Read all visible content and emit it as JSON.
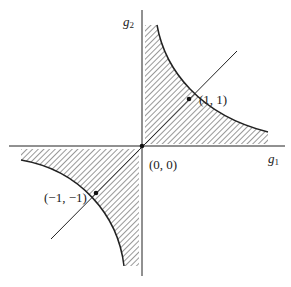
{
  "diagram": {
    "axes": {
      "x_label": "g",
      "x_sub": "1",
      "y_label": "g",
      "y_sub": "2"
    },
    "points": [
      {
        "label": "(1, 1)",
        "x": 1,
        "y": 1
      },
      {
        "label": "(0, 0)",
        "x": 0,
        "y": 0
      },
      {
        "label": "(−1, −1)",
        "x": -1,
        "y": -1
      }
    ],
    "regions": [
      {
        "description": "hatched region in first quadrant bounded by axes and hyperbola g1*g2 = 1"
      },
      {
        "description": "hatched region in third quadrant bounded by axes and hyperbola g1*g2 = 1"
      }
    ],
    "line": "diagonal g2 = g1"
  }
}
